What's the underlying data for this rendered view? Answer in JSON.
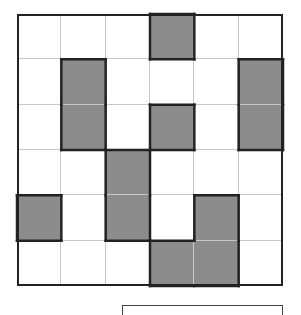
{
  "puzzle": {
    "rows": 6,
    "cols": 6,
    "shade_color": "#8c8c8c",
    "line_color": "#222222",
    "grid_line_color": "#c8c8c8",
    "shaded_cells": [
      [
        0,
        3
      ],
      [
        1,
        1
      ],
      [
        1,
        5
      ],
      [
        2,
        1
      ],
      [
        2,
        3
      ],
      [
        2,
        5
      ],
      [
        3,
        2
      ],
      [
        4,
        0
      ],
      [
        4,
        2
      ],
      [
        4,
        4
      ],
      [
        5,
        3
      ],
      [
        5,
        4
      ]
    ],
    "regions": [
      {
        "name": "region-top-mid",
        "cells": [
          [
            0,
            3
          ]
        ]
      },
      {
        "name": "region-left-bar",
        "cells": [
          [
            1,
            1
          ],
          [
            2,
            1
          ]
        ]
      },
      {
        "name": "region-right-bar",
        "cells": [
          [
            1,
            5
          ],
          [
            2,
            5
          ]
        ]
      },
      {
        "name": "region-center-square",
        "cells": [
          [
            2,
            3
          ]
        ]
      },
      {
        "name": "region-mid-bar",
        "cells": [
          [
            3,
            2
          ],
          [
            4,
            2
          ]
        ]
      },
      {
        "name": "region-left-square",
        "cells": [
          [
            4,
            0
          ]
        ]
      },
      {
        "name": "region-bottom-l",
        "cells": [
          [
            4,
            4
          ],
          [
            5,
            3
          ],
          [
            5,
            4
          ]
        ]
      }
    ]
  },
  "answer_box": {
    "value": ""
  }
}
